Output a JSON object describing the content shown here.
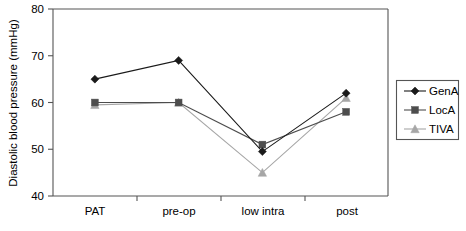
{
  "chart_data": {
    "type": "line",
    "title": "",
    "xlabel": "",
    "ylabel": "Diastolic blood pressure (mmHg)",
    "categories": [
      "PAT",
      "pre-op",
      "low intra",
      "post"
    ],
    "ylim": [
      40,
      80
    ],
    "yticks": [
      40,
      50,
      60,
      70,
      80
    ],
    "ytick_labels": [
      "40",
      "50",
      "60",
      "70",
      "80"
    ],
    "grid": false,
    "legend_position": "right",
    "series": [
      {
        "name": "GenA",
        "marker": "diamond",
        "color": "#1a1a1a",
        "values": [
          65,
          69,
          49.5,
          62
        ]
      },
      {
        "name": "LocA",
        "marker": "square",
        "color": "#4d4d4d",
        "values": [
          60,
          60,
          51,
          58
        ]
      },
      {
        "name": "TIVA",
        "marker": "triangle",
        "color": "#a6a6a6",
        "values": [
          59.5,
          60,
          45,
          61
        ]
      }
    ]
  },
  "axis": {
    "y_title": "Diastolic blood pressure (mmHg)",
    "y_tick_0": "40",
    "y_tick_1": "50",
    "y_tick_2": "60",
    "y_tick_3": "70",
    "y_tick_4": "80",
    "x_cat_0": "PAT",
    "x_cat_1": "pre-op",
    "x_cat_2": "low intra",
    "x_cat_3": "post"
  },
  "legend": {
    "items": [
      {
        "label": "GenA",
        "marker": "diamond",
        "color": "#1a1a1a"
      },
      {
        "label": "LocA",
        "marker": "square",
        "color": "#4d4d4d"
      },
      {
        "label": "TIVA",
        "marker": "triangle",
        "color": "#a6a6a6"
      }
    ],
    "item_0_label": "GenA",
    "item_1_label": "LocA",
    "item_2_label": "TIVA"
  },
  "colors": {
    "gena": "#1a1a1a",
    "loca": "#4d4d4d",
    "tiva": "#a6a6a6",
    "frame": "#555555",
    "background": "#ffffff"
  }
}
